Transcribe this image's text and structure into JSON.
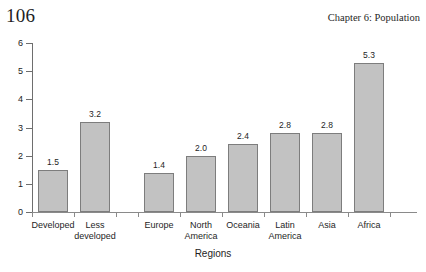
{
  "page": {
    "number": "106",
    "chapter_title": "Chapter 6: Population"
  },
  "chart_data": {
    "type": "bar",
    "title": "",
    "xlabel": "Regions",
    "ylabel": "",
    "ylim": [
      0,
      6
    ],
    "yticks": [
      "0",
      "1",
      "2",
      "3",
      "4",
      "5",
      "6"
    ],
    "grid": false,
    "legend": "none",
    "categories": [
      "Developed",
      "Less developed",
      "Europe",
      "North America",
      "Oceania",
      "Latin America",
      "Asia",
      "Africa"
    ],
    "values": [
      1.5,
      3.2,
      1.4,
      2.0,
      2.4,
      2.8,
      2.8,
      5.3
    ],
    "value_labels": [
      "1.5",
      "3.2",
      "1.4",
      "2.0",
      "2.4",
      "2.8",
      "2.8",
      "5.3"
    ],
    "category_label_lines": [
      [
        "Developed"
      ],
      [
        "Less",
        "developed"
      ],
      [
        "Europe"
      ],
      [
        "North",
        "America"
      ],
      [
        "Oceania"
      ],
      [
        "Latin",
        "America"
      ],
      [
        "Asia"
      ],
      [
        "Africa"
      ]
    ],
    "groups": [
      {
        "name": "development-level",
        "members": [
          "Developed",
          "Less developed"
        ]
      },
      {
        "name": "world-regions",
        "members": [
          "Europe",
          "North America",
          "Oceania",
          "Latin America",
          "Asia",
          "Africa"
        ]
      }
    ],
    "colors": {
      "bar_fill": "#c2c2c2",
      "bar_border": "#7d7d7d",
      "axis": "#6e6e6e",
      "text": "#1e1e1e"
    }
  }
}
